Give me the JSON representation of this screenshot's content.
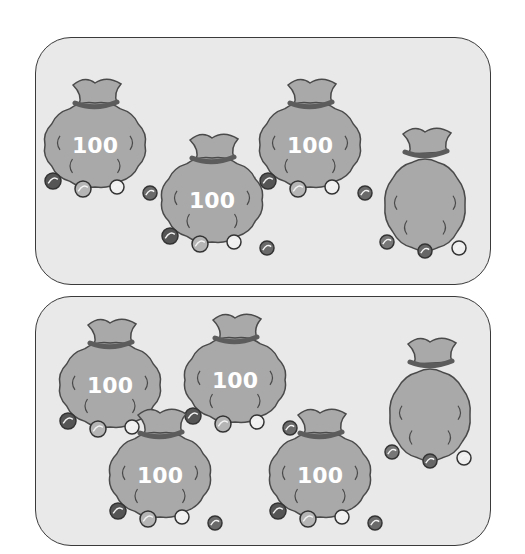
{
  "colors": {
    "panel_fill": "#e9e9e9",
    "panel_border": "#3a3a3a",
    "bag_fill": "#a9a9a9",
    "bag_outline": "#4a4a4a",
    "bag_tie": "#5c5c5c",
    "label_text": "#ffffff"
  },
  "panels": [
    {
      "name": "top",
      "bags": [
        {
          "label": "100",
          "size": "large"
        },
        {
          "label": "100",
          "size": "large"
        },
        {
          "label": "100",
          "size": "large"
        },
        {
          "label": "",
          "size": "small"
        }
      ]
    },
    {
      "name": "bottom",
      "bags": [
        {
          "label": "100",
          "size": "large"
        },
        {
          "label": "100",
          "size": "large"
        },
        {
          "label": "100",
          "size": "large"
        },
        {
          "label": "100",
          "size": "large"
        },
        {
          "label": "",
          "size": "small"
        }
      ]
    }
  ]
}
